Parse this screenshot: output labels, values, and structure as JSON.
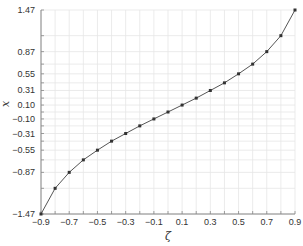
{
  "chart_data": {
    "type": "line",
    "title": "",
    "xlabel": "ζ",
    "ylabel": "x",
    "xlim": [
      -0.9,
      0.9
    ],
    "ylim": [
      -1.47,
      1.47
    ],
    "grid": true,
    "legend": null,
    "x_ticks": [
      "-0.9",
      "-0.7",
      "-0.5",
      "-0.3",
      "-0.1",
      "0.1",
      "0.3",
      "0.5",
      "0.7",
      "0.9"
    ],
    "y_ticks": [
      "1.47",
      "0.87",
      "0.55",
      "0.31",
      "0.10",
      "-0.10",
      "-0.31",
      "-0.55",
      "-0.87",
      "-1.47"
    ],
    "series": [
      {
        "name": "x = atanh(ζ)",
        "color": "#555555",
        "marker_color": "#333333",
        "x": [
          -0.9,
          -0.8,
          -0.7,
          -0.6,
          -0.5,
          -0.4,
          -0.3,
          -0.2,
          -0.1,
          0.0,
          0.1,
          0.2,
          0.3,
          0.4,
          0.5,
          0.6,
          0.7,
          0.8,
          0.9
        ],
        "y": [
          -1.47,
          -1.1,
          -0.87,
          -0.69,
          -0.55,
          -0.42,
          -0.31,
          -0.2,
          -0.1,
          0.0,
          0.1,
          0.2,
          0.31,
          0.42,
          0.55,
          0.69,
          0.87,
          1.1,
          1.47
        ]
      }
    ]
  },
  "colors": {
    "axis": "#888888",
    "grid": "#e6e6e6",
    "line": "#555555",
    "marker": "#333333"
  }
}
